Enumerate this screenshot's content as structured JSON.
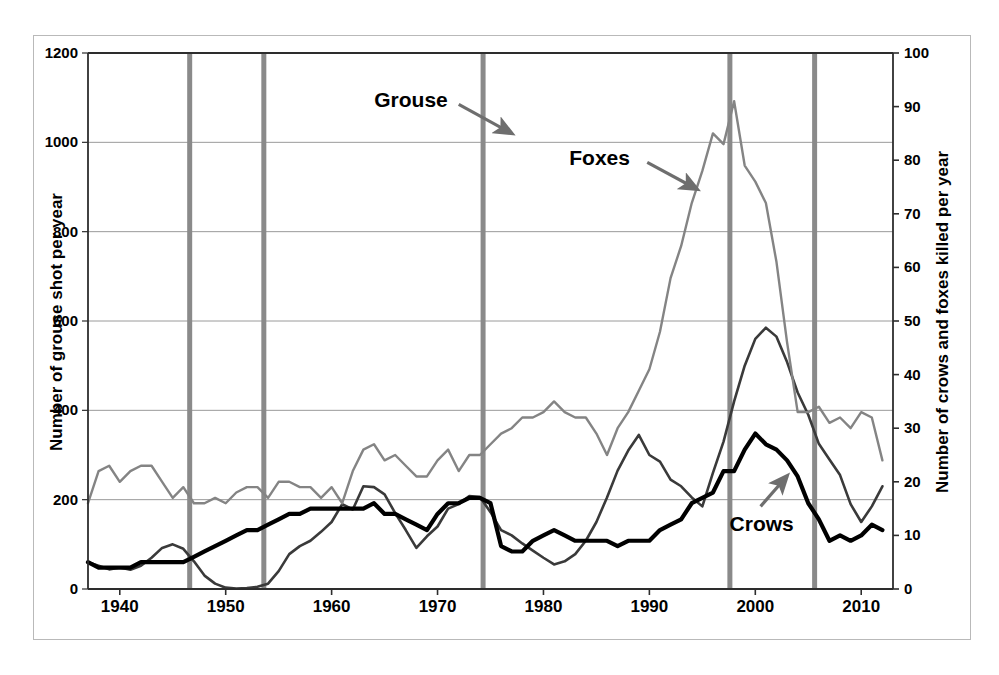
{
  "chart_data": {
    "type": "line",
    "title": "",
    "xlabel": "",
    "ylabel": "Number of grouse shot per year",
    "y2label": "Number of crows and foxes killed per year",
    "xlim": [
      1937,
      2013
    ],
    "ylim": [
      0,
      1200
    ],
    "y2lim": [
      0,
      100
    ],
    "grid": true,
    "legend_position": "inline-annotations",
    "x_ticks": [
      "1940",
      "1950",
      "1960",
      "1970",
      "1980",
      "1990",
      "2000",
      "2010"
    ],
    "x_tick_values": [
      1940,
      1950,
      1960,
      1970,
      1980,
      1990,
      2000,
      2010
    ],
    "y_ticks": [
      "0",
      "200",
      "400",
      "600",
      "800",
      "1000",
      "1200"
    ],
    "y_tick_values": [
      0,
      200,
      400,
      600,
      800,
      1000,
      1200
    ],
    "y2_ticks": [
      "0",
      "10",
      "20",
      "30",
      "40",
      "50",
      "60",
      "70",
      "80",
      "90",
      "100"
    ],
    "y2_tick_values": [
      0,
      10,
      20,
      30,
      40,
      50,
      60,
      70,
      80,
      90,
      100
    ],
    "x": [
      1937,
      1938,
      1939,
      1940,
      1941,
      1942,
      1943,
      1944,
      1945,
      1946,
      1947,
      1948,
      1949,
      1950,
      1951,
      1952,
      1953,
      1954,
      1955,
      1956,
      1957,
      1958,
      1959,
      1960,
      1961,
      1962,
      1963,
      1964,
      1965,
      1966,
      1967,
      1968,
      1969,
      1970,
      1971,
      1972,
      1973,
      1974,
      1975,
      1976,
      1977,
      1978,
      1979,
      1980,
      1981,
      1982,
      1983,
      1984,
      1985,
      1986,
      1987,
      1988,
      1989,
      1990,
      1991,
      1992,
      1993,
      1994,
      1995,
      1996,
      1997,
      1998,
      1999,
      2000,
      2001,
      2002,
      2003,
      2004,
      2005,
      2006,
      2007,
      2008,
      2009,
      2010,
      2011,
      2012
    ],
    "series": [
      {
        "name": "Grouse",
        "axis": "left",
        "units": "grouse shot per year",
        "color": "#3a3a3a",
        "stroke_width": 2.6,
        "values": [
          60,
          52,
          44,
          48,
          43,
          52,
          70,
          92,
          100,
          90,
          62,
          30,
          12,
          3,
          1,
          2,
          5,
          12,
          40,
          78,
          96,
          108,
          128,
          150,
          190,
          178,
          230,
          228,
          212,
          170,
          132,
          92,
          118,
          140,
          180,
          190,
          208,
          206,
          172,
          132,
          120,
          102,
          86,
          70,
          55,
          62,
          78,
          108,
          150,
          205,
          265,
          310,
          345,
          300,
          285,
          245,
          230,
          205,
          185,
          260,
          330,
          420,
          500,
          560,
          585,
          565,
          508,
          440,
          390,
          325,
          290,
          255,
          190,
          150,
          185,
          230
        ]
      },
      {
        "name": "Foxes",
        "axis": "right",
        "units": "foxes killed per year",
        "color": "#848484",
        "stroke_width": 2.4,
        "values": [
          16,
          22,
          23,
          20,
          22,
          23,
          23,
          20,
          17,
          19,
          16,
          16,
          17,
          16,
          18,
          19,
          19,
          17,
          20,
          20,
          19,
          19,
          17,
          19,
          16,
          22,
          26,
          27,
          24,
          25,
          23,
          21,
          21,
          24,
          26,
          22,
          25,
          25,
          27,
          29,
          30,
          32,
          32,
          33,
          35,
          33,
          32,
          32,
          29,
          25,
          30,
          33,
          37,
          41,
          48,
          58,
          64,
          72,
          78,
          85,
          83,
          91,
          79,
          76,
          72,
          61,
          46,
          33,
          33,
          34,
          31,
          32,
          30,
          33,
          32,
          24
        ]
      },
      {
        "name": "Crows",
        "axis": "right",
        "units": "crows killed per year",
        "color": "#000000",
        "stroke_width": 4.2,
        "values": [
          5,
          4,
          4,
          4,
          4,
          5,
          5,
          5,
          5,
          5,
          6,
          7,
          8,
          9,
          10,
          11,
          11,
          12,
          13,
          14,
          14,
          15,
          15,
          15,
          15,
          15,
          15,
          16,
          14,
          14,
          13,
          12,
          11,
          14,
          16,
          16,
          17,
          17,
          16,
          8,
          7,
          7,
          9,
          10,
          11,
          10,
          9,
          9,
          9,
          9,
          8,
          9,
          9,
          9,
          11,
          12,
          13,
          16,
          17,
          18,
          22,
          22,
          26,
          29,
          27,
          26,
          24,
          21,
          16,
          13,
          9,
          10,
          9,
          10,
          12,
          11
        ]
      }
    ],
    "event_markers": {
      "name": "gamekeeper-change-bars",
      "color": "#8a8a8a",
      "width_px": 5,
      "x_values": [
        1946.6,
        1953.6,
        1974.3,
        1997.6,
        2005.6
      ]
    },
    "annotations": [
      {
        "label": "Grouse",
        "target_series": "Grouse",
        "text_x": 1967.5,
        "text_y_left": 1095,
        "arrow_from_x": 1972.0,
        "arrow_from_y": 1085,
        "arrow_to_x": 1977.0,
        "arrow_to_y": 1020
      },
      {
        "label": "Foxes",
        "target_series": "Foxes",
        "text_x": 1985.3,
        "text_y_left": 965,
        "arrow_from_x": 1989.8,
        "arrow_from_y": 955,
        "arrow_to_x": 1994.5,
        "arrow_to_y": 895
      },
      {
        "label": "Crows",
        "target_series": "Crows",
        "text_x": 2000.6,
        "text_y_left": 145,
        "arrow_from_x": 2000.5,
        "arrow_from_y": 185,
        "arrow_to_x": 2003.0,
        "arrow_to_y": 253
      }
    ]
  }
}
